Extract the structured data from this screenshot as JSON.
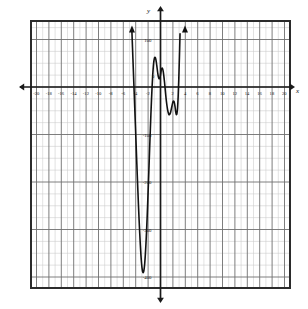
{
  "panel": {
    "label": "b."
  },
  "axes": {
    "x_name": "x",
    "y_name": "y",
    "x_ticks": [
      "-20",
      "-18",
      "-16",
      "-14",
      "-12",
      "-10",
      "-8",
      "-6",
      "-4",
      "-2",
      "2",
      "4",
      "6",
      "8",
      "10",
      "12",
      "14",
      "16",
      "18",
      "20"
    ],
    "y_ticks": [
      "100",
      "-100",
      "-200",
      "-300",
      "-400"
    ],
    "origin_label": "0"
  },
  "colors": {
    "grid_minor": "#c9c9c9",
    "grid_major": "#6f6f6f",
    "frame": "#2b2b2b",
    "axis": "#1a1a1a",
    "curve": "#111111",
    "background": "#ffffff"
  },
  "chart_data": {
    "type": "line",
    "title": "",
    "xlabel": "x",
    "ylabel": "y",
    "xlim": [
      -21,
      21
    ],
    "ylim": [
      -430,
      130
    ],
    "grid": true,
    "legend": null,
    "x_major_step": 2,
    "x_minor_step": 1,
    "y_major_step": 100,
    "y_minor_step": 25,
    "annotations": [
      {
        "text": "arrow up at left branch",
        "x": -4.6,
        "y": 120
      },
      {
        "text": "arrow up at right branch",
        "x": 3.95,
        "y": 120
      }
    ],
    "features": {
      "local_max": {
        "x": 0.5,
        "y": 40
      },
      "local_min_right": {
        "x": 3.0,
        "y": -55
      },
      "global_min": {
        "x": -3.05,
        "y": -385
      },
      "x_intercepts": [
        -4.3,
        -1.6,
        1.6,
        3.6
      ]
    },
    "series": [
      {
        "name": "polynomial",
        "x": [
          -4.62,
          -4.55,
          -4.45,
          -4.35,
          -4.25,
          -4.15,
          -4.05,
          -3.95,
          -3.85,
          -3.75,
          -3.65,
          -3.55,
          -3.45,
          -3.35,
          -3.25,
          -3.15,
          -3.05,
          -2.95,
          -2.85,
          -2.75,
          -2.65,
          -2.55,
          -2.45,
          -2.35,
          -2.25,
          -2.15,
          -2.05,
          -1.95,
          -1.85,
          -1.75,
          -1.65,
          -1.55,
          -1.45,
          -1.35,
          -1.25,
          -1.15,
          -1.05,
          -0.95,
          -0.85,
          -0.75,
          -0.65,
          -0.55,
          -0.45,
          -0.35,
          -0.25,
          -0.15,
          -0.05,
          0.05,
          0.15,
          0.25,
          0.35,
          0.45,
          0.55,
          0.65,
          0.75,
          0.85,
          0.95,
          1.05,
          1.15,
          1.25,
          1.35,
          1.45,
          1.55,
          1.65,
          1.75,
          1.85,
          1.95,
          2.05,
          2.15,
          2.25,
          2.35,
          2.45,
          2.55,
          2.65,
          2.75,
          2.85,
          2.95,
          3.05,
          3.15,
          3.25,
          3.35,
          3.45,
          3.55,
          3.65,
          3.75,
          3.85,
          3.95
        ],
        "y": [
          120,
          95,
          60,
          25,
          -10,
          -45,
          -80,
          -115,
          -150,
          -185,
          -218,
          -250,
          -280,
          -308,
          -333,
          -355,
          -372,
          -384,
          -390,
          -390,
          -384,
          -372,
          -354,
          -331,
          -304,
          -273,
          -239,
          -203,
          -166,
          -129,
          -93,
          -58,
          -26,
          2,
          26,
          44,
          56,
          62,
          62,
          58,
          50,
          40,
          30,
          22,
          18,
          18,
          22,
          30,
          38,
          40,
          38,
          32,
          22,
          10,
          -4,
          -18,
          -30,
          -40,
          -48,
          -54,
          -58,
          -58,
          -56,
          -52,
          -46,
          -40,
          -34,
          -30,
          -30,
          -34,
          -42,
          -52,
          -58,
          -56,
          -44,
          -20,
          16,
          62,
          112,
          0,
          0,
          0,
          0,
          0,
          0,
          0,
          0
        ]
      }
    ]
  }
}
